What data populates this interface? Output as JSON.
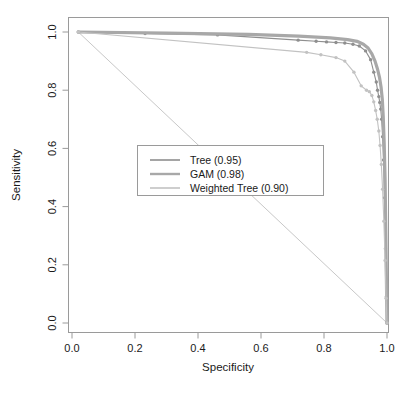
{
  "chart_data": {
    "type": "line",
    "title": "",
    "xlabel": "Specificity",
    "ylabel": "Sensitivity",
    "xlim": [
      0.0,
      1.0
    ],
    "ylim": [
      0.0,
      1.0
    ],
    "x_ticks": [
      "0.0",
      "0.2",
      "0.4",
      "0.6",
      "0.8",
      "1.0"
    ],
    "x_tick_values": [
      0.0,
      0.2,
      0.4,
      0.6,
      0.8,
      1.0
    ],
    "y_ticks": [
      "0.0",
      "0.2",
      "0.4",
      "0.6",
      "0.8",
      "1.0"
    ],
    "y_tick_values": [
      0.0,
      0.2,
      0.4,
      0.6,
      0.8,
      1.0
    ],
    "grid": false,
    "legend_position": "center-left",
    "x_axis_reversed": true,
    "series": [
      {
        "name": "Tree",
        "auc": "0.95",
        "legend_label": "Tree (0.95)",
        "color": "#8f8f8f",
        "line_width": 1.1,
        "markers": true,
        "points": [
          [
            0.02,
            1.0
          ],
          [
            0.232,
            0.995
          ],
          [
            0.462,
            0.99
          ],
          [
            0.718,
            0.972
          ],
          [
            0.775,
            0.968
          ],
          [
            0.808,
            0.966
          ],
          [
            0.838,
            0.964
          ],
          [
            0.866,
            0.962
          ],
          [
            0.892,
            0.958
          ],
          [
            0.912,
            0.952
          ],
          [
            0.932,
            0.935
          ],
          [
            0.948,
            0.905
          ],
          [
            0.958,
            0.862
          ],
          [
            0.966,
            0.828
          ],
          [
            0.97,
            0.8
          ],
          [
            0.974,
            0.778
          ],
          [
            0.977,
            0.758
          ],
          [
            0.98,
            0.735
          ],
          [
            0.983,
            0.7
          ],
          [
            0.986,
            0.64
          ],
          [
            0.989,
            0.56
          ],
          [
            0.992,
            0.43
          ],
          [
            0.995,
            0.255
          ],
          [
            0.998,
            0.09
          ],
          [
            1.0,
            0.0
          ]
        ]
      },
      {
        "name": "GAM",
        "auc": "0.98",
        "legend_label": "GAM (0.98)",
        "color": "#a8a8a8",
        "line_width": 3.2,
        "markers": false,
        "points": [
          [
            0.02,
            1.0
          ],
          [
            0.3,
            0.996
          ],
          [
            0.56,
            0.992
          ],
          [
            0.72,
            0.986
          ],
          [
            0.82,
            0.98
          ],
          [
            0.875,
            0.974
          ],
          [
            0.905,
            0.968
          ],
          [
            0.925,
            0.958
          ],
          [
            0.94,
            0.945
          ],
          [
            0.952,
            0.925
          ],
          [
            0.962,
            0.9
          ],
          [
            0.97,
            0.872
          ],
          [
            0.976,
            0.845
          ],
          [
            0.981,
            0.812
          ],
          [
            0.985,
            0.77
          ],
          [
            0.988,
            0.71
          ],
          [
            0.991,
            0.62
          ],
          [
            0.994,
            0.49
          ],
          [
            0.996,
            0.33
          ],
          [
            0.998,
            0.16
          ],
          [
            1.0,
            0.0
          ]
        ]
      },
      {
        "name": "Weighted Tree",
        "auc": "0.90",
        "legend_label": "Weighted Tree (0.90)",
        "color": "#c2c2c2",
        "line_width": 1.1,
        "markers": true,
        "points": [
          [
            0.02,
            1.0
          ],
          [
            0.745,
            0.93
          ],
          [
            0.79,
            0.922
          ],
          [
            0.838,
            0.912
          ],
          [
            0.866,
            0.9
          ],
          [
            0.895,
            0.862
          ],
          [
            0.918,
            0.815
          ],
          [
            0.935,
            0.8
          ],
          [
            0.944,
            0.795
          ],
          [
            0.952,
            0.782
          ],
          [
            0.958,
            0.76
          ],
          [
            0.964,
            0.73
          ],
          [
            0.969,
            0.7
          ],
          [
            0.974,
            0.66
          ],
          [
            0.978,
            0.61
          ],
          [
            0.982,
            0.545
          ],
          [
            0.986,
            0.46
          ],
          [
            0.99,
            0.35
          ],
          [
            0.994,
            0.215
          ],
          [
            0.997,
            0.085
          ],
          [
            1.0,
            0.0
          ]
        ]
      }
    ],
    "diagonal_reference": {
      "present": true,
      "from": [
        0.02,
        1.0
      ],
      "to": [
        1.0,
        0.0
      ],
      "color": "#c8c8c8"
    }
  },
  "legend": {
    "entries": [
      {
        "label": "Tree (0.95)"
      },
      {
        "label": "GAM (0.98)"
      },
      {
        "label": "Weighted Tree (0.90)"
      }
    ]
  },
  "axes": {
    "x_title": "Specificity",
    "y_title": "Sensitivity"
  }
}
